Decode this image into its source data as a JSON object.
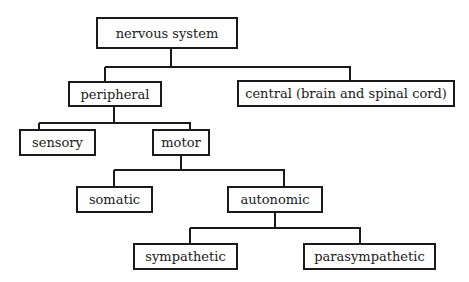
{
  "diagram": {
    "type": "tree",
    "title": "nervous system",
    "nodes": {
      "root": {
        "label": "nervous system"
      },
      "peripheral": {
        "label": "peripheral"
      },
      "central": {
        "label": "central (brain and spinal cord)"
      },
      "sensory": {
        "label": "sensory"
      },
      "motor": {
        "label": "motor"
      },
      "somatic": {
        "label": "somatic"
      },
      "autonomic": {
        "label": "autonomic"
      },
      "sympathetic": {
        "label": "sympathetic"
      },
      "parasympathetic": {
        "label": "parasympathetic"
      }
    },
    "edges": [
      [
        "root",
        "peripheral"
      ],
      [
        "root",
        "central"
      ],
      [
        "peripheral",
        "sensory"
      ],
      [
        "peripheral",
        "motor"
      ],
      [
        "motor",
        "somatic"
      ],
      [
        "motor",
        "autonomic"
      ],
      [
        "autonomic",
        "sympathetic"
      ],
      [
        "autonomic",
        "parasympathetic"
      ]
    ],
    "colors": {
      "line": "#1a1a1a",
      "background": "#ffffff"
    }
  }
}
